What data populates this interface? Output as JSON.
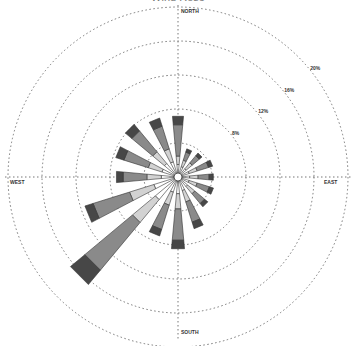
{
  "title": "Wind Rose",
  "chart_data": {
    "type": "wind_rose",
    "title": "",
    "directions": [
      "N",
      "NNE",
      "NE",
      "ENE",
      "E",
      "ESE",
      "SE",
      "SSE",
      "S",
      "SSW",
      "SW",
      "WSW",
      "W",
      "WNW",
      "NW",
      "NNW"
    ],
    "compass_labels": {
      "north": "NORTH",
      "south": "SOUTH",
      "west": "WEST",
      "east": "EAST"
    },
    "ring_labels": [
      "4%",
      "8%",
      "12%",
      "16%",
      "20%"
    ],
    "ring_values": [
      4,
      8,
      12,
      16,
      20
    ],
    "rmax": 21,
    "bins": [
      "bin1",
      "bin2",
      "bin3",
      "bin4"
    ],
    "bin_colors": [
      "#ffffff",
      "#d2d2d2",
      "#8a8a8a",
      "#474747"
    ],
    "series": [
      {
        "name": "bin1",
        "values": [
          1.0,
          0.8,
          0.8,
          0.9,
          0.9,
          0.9,
          1.0,
          1.2,
          1.5,
          1.4,
          3.0,
          2.5,
          1.5,
          1.5,
          1.6,
          1.4
        ]
      },
      {
        "name": "bin2",
        "values": [
          1.0,
          0.8,
          0.9,
          1.0,
          1.0,
          1.0,
          1.1,
          1.4,
          1.8,
          1.6,
          3.5,
          3.0,
          1.7,
          1.7,
          1.8,
          1.6
        ]
      },
      {
        "name": "bin3",
        "values": [
          3.7,
          1.0,
          1.1,
          1.4,
          1.3,
          1.5,
          1.5,
          2.5,
          3.7,
          3.0,
          7.3,
          4.5,
          2.8,
          3.0,
          3.2,
          2.8
        ]
      },
      {
        "name": "bin4",
        "values": [
          1.0,
          0.4,
          0.4,
          0.5,
          0.5,
          0.5,
          0.5,
          0.8,
          1.0,
          0.8,
          2.2,
          1.0,
          0.8,
          1.0,
          1.0,
          1.0
        ]
      }
    ],
    "totals": [
      6.7,
      3.0,
      3.2,
      3.8,
      3.7,
      3.9,
      4.1,
      5.9,
      8.0,
      6.8,
      16.0,
      11.0,
      6.8,
      7.2,
      7.6,
      6.8
    ],
    "grid": true,
    "legend": null
  }
}
